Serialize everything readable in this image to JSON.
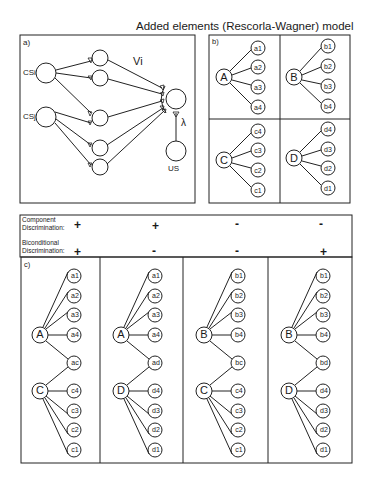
{
  "title": "Added elements (Rescorla-Wagner) model",
  "panel_a": {
    "label": "a)",
    "cs_i": "CSi",
    "cs_j": "CSj",
    "weight_label": "Vi",
    "lambda_label": "λ",
    "us_label": "US"
  },
  "panel_b": {
    "label": "b)",
    "groups": [
      {
        "stimulus": "A",
        "elements": [
          "a1",
          "a2",
          "a3",
          "a4"
        ]
      },
      {
        "stimulus": "B",
        "elements": [
          "b1",
          "b2",
          "b3",
          "b4"
        ]
      },
      {
        "stimulus": "C",
        "elements": [
          "c4",
          "c3",
          "c2",
          "c1"
        ]
      },
      {
        "stimulus": "D",
        "elements": [
          "d4",
          "d3",
          "d2",
          "d1"
        ]
      }
    ]
  },
  "table": {
    "row1_label_line1": "Component",
    "row1_label_line2": "Discrimination:",
    "row2_label_line1": "Biconditional",
    "row2_label_line2": "Discrimination:",
    "component": [
      "+",
      "+",
      "-",
      "-"
    ],
    "biconditional": [
      "+",
      "-",
      "-",
      "+"
    ]
  },
  "panel_c": {
    "label": "c)",
    "columns": [
      {
        "top": "A",
        "top_elements": [
          "a1",
          "a2",
          "a3",
          "a4"
        ],
        "config": "ac",
        "bottom": "C",
        "bottom_elements": [
          "c4",
          "c3",
          "c2",
          "c1"
        ]
      },
      {
        "top": "A",
        "top_elements": [
          "a1",
          "a2",
          "a3",
          "a4"
        ],
        "config": "ad",
        "bottom": "D",
        "bottom_elements": [
          "d4",
          "d3",
          "d2",
          "d1"
        ]
      },
      {
        "top": "B",
        "top_elements": [
          "b1",
          "b2",
          "b3",
          "b4"
        ],
        "config": "bc",
        "bottom": "C",
        "bottom_elements": [
          "c4",
          "c3",
          "c2",
          "c1"
        ]
      },
      {
        "top": "B",
        "top_elements": [
          "b1",
          "b2",
          "b3",
          "b4"
        ],
        "config": "bd",
        "bottom": "D",
        "bottom_elements": [
          "d4",
          "d3",
          "d2",
          "d1"
        ]
      }
    ]
  }
}
